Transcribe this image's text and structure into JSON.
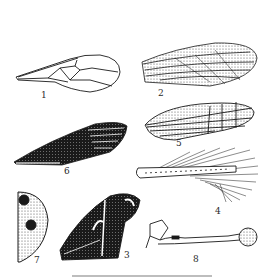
{
  "figure": {
    "type": "scientific-illustration",
    "panels": [
      {
        "id": 1,
        "label": "1",
        "description": "membranous wing with sparse venation"
      },
      {
        "id": 2,
        "label": "2",
        "description": "stippled leathery wing with dense veins"
      },
      {
        "id": 3,
        "label": "3",
        "description": "dark scaled wing with pale markings"
      },
      {
        "id": 4,
        "label": "4",
        "description": "fringed narrow wing with long hairs"
      },
      {
        "id": 5,
        "label": "5",
        "description": "net-veined wing"
      },
      {
        "id": 6,
        "label": "6",
        "description": "dark hemelytron-like wing with striations"
      },
      {
        "id": 7,
        "label": "7",
        "description": "hardened elytron with dark spots"
      },
      {
        "id": 8,
        "label": "8",
        "description": "club-shaped haltere"
      }
    ],
    "colors": {
      "ink": "#1a1a1a",
      "paper": "#ffffff"
    }
  }
}
